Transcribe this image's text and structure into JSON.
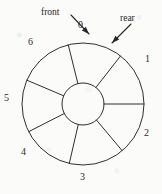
{
  "figure": {
    "type": "circular-queue-wheel-diagram",
    "background_color": "#fbfbfa",
    "ink_color": "#2f2f33"
  },
  "wheel": {
    "center_x": 83,
    "center_y": 104,
    "outer_radius": 61,
    "hub_radius": 21,
    "slot_count": 7
  },
  "slots": [
    {
      "label": "0",
      "x": 78,
      "y": 20
    },
    {
      "label": "1",
      "x": 145,
      "y": 54
    },
    {
      "label": "2",
      "x": 144,
      "y": 128
    },
    {
      "label": "3",
      "x": 80,
      "y": 172
    },
    {
      "label": "4",
      "x": 21,
      "y": 147
    },
    {
      "label": "5",
      "x": 4,
      "y": 93
    },
    {
      "label": "6",
      "x": 28,
      "y": 37
    }
  ],
  "callouts": [
    {
      "label": "front",
      "label_x": 41,
      "label_y": 8,
      "line_x1": 71,
      "line_y1": 15,
      "line_x2": 89,
      "line_y2": 34
    },
    {
      "label": "rear",
      "label_x": 120,
      "label_y": 14,
      "line_x1": 131,
      "line_y1": 24,
      "line_x2": 112,
      "line_y2": 43
    }
  ],
  "spokes": [
    {
      "name": "spoke-0-6",
      "angle_deg": 256
    },
    {
      "name": "spoke-0-1",
      "angle_deg": 308
    },
    {
      "name": "spoke-1-2",
      "angle_deg": 0
    },
    {
      "name": "spoke-2-3",
      "angle_deg": 50
    },
    {
      "name": "spoke-3-4",
      "angle_deg": 103
    },
    {
      "name": "spoke-4-5",
      "angle_deg": 153
    },
    {
      "name": "spoke-5-6",
      "angle_deg": 203
    }
  ]
}
